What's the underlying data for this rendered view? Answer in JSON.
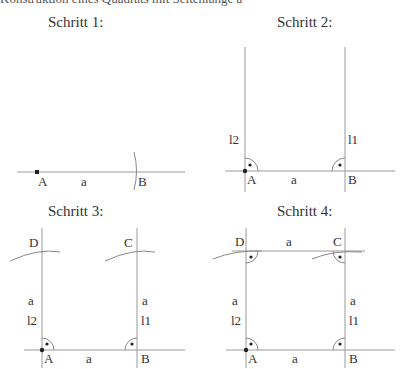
{
  "header": {
    "clipped_text": "Konstruktion eines Quadrats mit Seitenlänge a"
  },
  "steps": [
    {
      "title": "Schritt 1:",
      "labels": {
        "A": "A",
        "B": "B",
        "a": "a"
      }
    },
    {
      "title": "Schritt 2:",
      "labels": {
        "A": "A",
        "B": "B",
        "a": "a",
        "l1": "l1",
        "l2": "l2"
      }
    },
    {
      "title": "Schritt 3:",
      "labels": {
        "A": "A",
        "B": "B",
        "C": "C",
        "D": "D",
        "a_bottom": "a",
        "a_left": "a",
        "a_right": "a",
        "l1": "l1",
        "l2": "l2"
      }
    },
    {
      "title": "Schritt 4:",
      "labels": {
        "A": "A",
        "B": "B",
        "C": "C",
        "D": "D",
        "a_bottom": "a",
        "a_top": "a",
        "a_left": "a",
        "a_right": "a",
        "l1": "l1",
        "l2": "l2"
      }
    }
  ],
  "colors": {
    "line": "#9a9a9a",
    "point": "#222222",
    "text": "#333333"
  }
}
